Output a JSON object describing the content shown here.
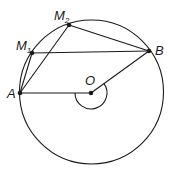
{
  "diagram": {
    "type": "geometry-circle",
    "circle": {
      "center": "O",
      "cx": 91.5,
      "cy": 92,
      "r": 72
    },
    "points": {
      "A": {
        "label": "A",
        "x": 20,
        "y": 93
      },
      "O": {
        "label": "O",
        "x": 91,
        "y": 93
      },
      "B": {
        "label": "B",
        "x": 149,
        "y": 51
      },
      "M1": {
        "label": "M",
        "sub": "1",
        "x": 32,
        "y": 53
      },
      "M2": {
        "label": "M",
        "sub": "2",
        "x": 69,
        "y": 25
      }
    },
    "segments": [
      "A-O",
      "O-B",
      "A-M1",
      "M1-B",
      "A-M2",
      "M2-B"
    ],
    "angle_arc": {
      "vertex": "O",
      "from": "A",
      "to": "B",
      "reflex": true
    },
    "colors": {
      "stroke": "#1a1a1a",
      "background": "#ffffff"
    }
  }
}
